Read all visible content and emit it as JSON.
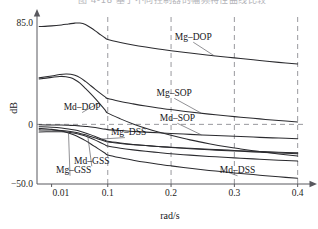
{
  "caption": {
    "text": "图 4-18  基于不同控制器的幅频特性曲线比较",
    "note": "cropped"
  },
  "chart_data": {
    "type": "line",
    "title": "",
    "subtitle": "",
    "xlabel": "rad/s",
    "ylabel": "dB",
    "xlim": [
      0.0055,
      0.41
    ],
    "ylim": [
      -50.0,
      85.0
    ],
    "grid": true,
    "grid_style": "dashed",
    "grid_x_values": [
      0.1,
      0.2,
      0.3,
      0.4
    ],
    "grid_y_values": [
      0
    ],
    "legend": "inline-annotations",
    "x_ticks": [
      "0.01",
      "0.1",
      "0.2",
      "0.3",
      "0.4"
    ],
    "x_tick_values": [
      0.01,
      0.1,
      0.2,
      0.3,
      0.4
    ],
    "y_ticks": [
      "85.0",
      "0",
      "-50.0"
    ],
    "y_tick_labels": [
      "85.0",
      "0",
      "−50.0"
    ],
    "y_tick_values": [
      85.0,
      0,
      -50.0
    ],
    "series": [
      {
        "name": "Mg-DOP",
        "label": "Mg–DOP",
        "x": [
          0.006,
          0.01,
          0.015,
          0.02,
          0.026,
          0.032,
          0.04,
          0.05,
          0.06,
          0.075,
          0.09,
          0.1,
          0.12,
          0.14,
          0.16,
          0.18,
          0.2,
          0.23,
          0.26,
          0.29,
          0.31,
          0.34,
          0.37,
          0.4
        ],
        "y": [
          82.0,
          82.6,
          83.4,
          84.2,
          84.9,
          85.0,
          83.8,
          81.0,
          78.4,
          75.0,
          72.4,
          71.2,
          68.7,
          66.6,
          64.8,
          63.2,
          61.8,
          59.8,
          58.0,
          56.3,
          55.2,
          53.6,
          52.0,
          50.6
        ]
      },
      {
        "name": "Mg-SOP",
        "label": "Mg–SOP",
        "x": [
          0.006,
          0.01,
          0.014,
          0.018,
          0.022,
          0.026,
          0.032,
          0.04,
          0.05,
          0.06,
          0.075,
          0.09,
          0.1,
          0.12,
          0.14,
          0.16,
          0.18,
          0.2,
          0.23,
          0.26,
          0.29,
          0.31,
          0.34,
          0.37,
          0.4
        ],
        "y": [
          39.0,
          40.6,
          41.8,
          42.2,
          42.0,
          41.2,
          39.2,
          36.0,
          32.4,
          29.4,
          25.8,
          23.0,
          21.6,
          19.2,
          17.2,
          15.4,
          13.8,
          12.4,
          10.4,
          8.6,
          7.0,
          6.0,
          4.6,
          3.2,
          2.0
        ]
      },
      {
        "name": "Md-DOP",
        "label": "Md–DOP",
        "x": [
          0.006,
          0.01,
          0.014,
          0.018,
          0.022,
          0.026,
          0.032,
          0.04,
          0.05,
          0.06,
          0.075,
          0.09,
          0.1,
          0.12,
          0.14,
          0.16,
          0.18,
          0.2,
          0.23,
          0.26,
          0.29,
          0.31,
          0.34,
          0.37,
          0.4
        ],
        "y": [
          38.0,
          39.4,
          40.2,
          40.0,
          39.0,
          37.4,
          34.6,
          30.2,
          25.6,
          21.6,
          16.4,
          12.0,
          9.4,
          4.6,
          0.4,
          -3.2,
          -6.4,
          -9.2,
          -13.0,
          -16.2,
          -19.0,
          -20.6,
          -22.8,
          -24.8,
          -26.6
        ]
      },
      {
        "name": "Md-SOP",
        "label": "Md–SOP",
        "x": [
          0.006,
          0.01,
          0.015,
          0.02,
          0.026,
          0.032,
          0.04,
          0.05,
          0.06,
          0.075,
          0.09,
          0.1,
          0.12,
          0.14,
          0.16,
          0.18,
          0.2,
          0.23,
          0.26,
          0.29,
          0.31,
          0.34,
          0.37,
          0.4
        ],
        "y": [
          -0.4,
          -0.5,
          -0.6,
          -0.8,
          -1.0,
          -1.3,
          -1.7,
          -2.2,
          -2.7,
          -3.4,
          -4.0,
          -4.4,
          -5.2,
          -5.9,
          -6.5,
          -7.1,
          -7.6,
          -8.4,
          -9.1,
          -9.8,
          -10.2,
          -10.9,
          -11.5,
          -12.1
        ]
      },
      {
        "name": "Mg-DSS",
        "label": "Mg–DSS",
        "x": [
          0.006,
          0.01,
          0.015,
          0.02,
          0.026,
          0.032,
          0.04,
          0.05,
          0.06,
          0.075,
          0.09,
          0.1,
          0.12,
          0.14,
          0.16,
          0.18,
          0.2,
          0.23,
          0.26,
          0.29,
          0.31,
          0.34,
          0.37,
          0.4
        ],
        "y": [
          -2.0,
          -2.4,
          -3.0,
          -3.8,
          -4.8,
          -5.8,
          -7.2,
          -8.8,
          -10.2,
          -12.0,
          -13.4,
          -14.2,
          -15.6,
          -16.8,
          -17.8,
          -18.6,
          -19.4,
          -20.4,
          -21.3,
          -22.1,
          -22.6,
          -23.3,
          -24.0,
          -24.6
        ]
      },
      {
        "name": "Md-GSS",
        "label": "Md–GSS",
        "x": [
          0.006,
          0.01,
          0.015,
          0.02,
          0.026,
          0.032,
          0.04,
          0.05,
          0.06,
          0.075,
          0.09,
          0.1,
          0.12,
          0.14,
          0.16,
          0.18,
          0.2,
          0.23,
          0.26,
          0.29,
          0.31,
          0.34,
          0.37,
          0.4
        ],
        "y": [
          -4.6,
          -4.8,
          -5.2,
          -5.8,
          -6.6,
          -7.6,
          -8.8,
          -10.2,
          -11.4,
          -13.0,
          -14.2,
          -14.8,
          -16.0,
          -17.0,
          -17.8,
          -18.6,
          -19.2,
          -20.1,
          -20.9,
          -21.6,
          -22.1,
          -22.7,
          -23.3,
          -23.9
        ]
      },
      {
        "name": "Mg-GSS",
        "label": "Mg–GSS",
        "x": [
          0.006,
          0.01,
          0.015,
          0.02,
          0.026,
          0.032,
          0.04,
          0.05,
          0.06,
          0.075,
          0.09,
          0.1,
          0.12,
          0.14,
          0.16,
          0.18,
          0.2,
          0.23,
          0.26,
          0.29,
          0.31,
          0.34,
          0.37,
          0.4
        ],
        "y": [
          -6.4,
          -6.2,
          -6.2,
          -6.6,
          -7.4,
          -8.4,
          -9.8,
          -11.6,
          -13.2,
          -15.4,
          -17.2,
          -18.2,
          -20.0,
          -21.4,
          -22.6,
          -23.6,
          -24.6,
          -25.8,
          -26.9,
          -27.8,
          -28.4,
          -29.2,
          -30.0,
          -30.8
        ]
      },
      {
        "name": "Md-DSS",
        "label": "Md–DSS",
        "x": [
          0.006,
          0.01,
          0.015,
          0.02,
          0.026,
          0.032,
          0.04,
          0.05,
          0.06,
          0.075,
          0.09,
          0.1,
          0.12,
          0.14,
          0.16,
          0.18,
          0.2,
          0.23,
          0.26,
          0.29,
          0.31,
          0.34,
          0.37,
          0.4
        ],
        "y": [
          -3.4,
          -4.2,
          -5.6,
          -7.2,
          -9.2,
          -11.2,
          -13.6,
          -16.4,
          -18.8,
          -21.8,
          -24.2,
          -25.6,
          -28.0,
          -30.0,
          -31.8,
          -33.4,
          -34.8,
          -36.8,
          -38.6,
          -40.2,
          -41.2,
          -42.6,
          -44.0,
          -45.2
        ]
      }
    ],
    "annotations": [
      {
        "text": "Mg–DOP",
        "x": 0.235,
        "y": 71.0
      },
      {
        "text": "Mg–SOP",
        "x": 0.205,
        "y": 24.0
      },
      {
        "text": "Md–DOP",
        "x": 0.035,
        "y": 12.0
      },
      {
        "text": "Md–SOP",
        "x": 0.21,
        "y": 3.0
      },
      {
        "text": "Mg–DSS",
        "x": 0.105,
        "y": -9.0
      },
      {
        "text": "Md–GSS",
        "x": 0.052,
        "y": -33.0
      },
      {
        "text": "Mg–GSS",
        "x": 0.012,
        "y": -41.0
      },
      {
        "text": "Md–DSS",
        "x": 0.305,
        "y": -41.0
      }
    ]
  }
}
